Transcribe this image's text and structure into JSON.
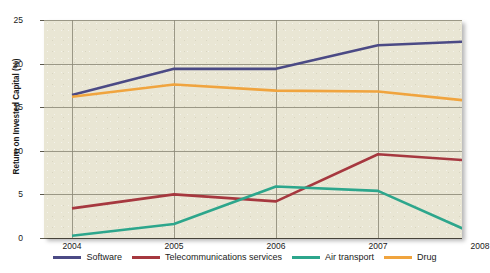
{
  "chart_data": {
    "type": "line",
    "title": "",
    "xlabel": "",
    "ylabel": "Return on Invested Capital (%)",
    "categories": [
      "2004",
      "2005",
      "2006",
      "2007",
      "2008"
    ],
    "x": [
      2004,
      2005,
      2006,
      2007,
      2008
    ],
    "ylim": [
      0,
      25
    ],
    "yticks": [
      0,
      5,
      10,
      15,
      20,
      25
    ],
    "grid": true,
    "legend_position": "bottom",
    "series": [
      {
        "name": "Software",
        "color": "#4b4a85",
        "values": [
          16.4,
          19.4,
          19.4,
          22.1,
          22.6
        ]
      },
      {
        "name": "Telecommunications services",
        "color": "#a6383f",
        "values": [
          3.4,
          5.0,
          4.2,
          9.6,
          8.8
        ]
      },
      {
        "name": "Air transport",
        "color": "#2da68c",
        "values": [
          0.25,
          1.6,
          5.9,
          5.4,
          0.2
        ]
      },
      {
        "name": "Drug",
        "color": "#f0a43e",
        "values": [
          16.2,
          17.6,
          16.9,
          16.8,
          15.6
        ]
      }
    ]
  },
  "axes": {
    "y_tick_labels": [
      "25",
      "20",
      "15",
      "10",
      "5",
      "0"
    ],
    "x_tick_labels": [
      "2004",
      "2005",
      "2006",
      "2007",
      "2008"
    ],
    "y_axis_title": "Return on Invested Capital (%)"
  },
  "legend": {
    "items": [
      {
        "label": "Software",
        "color": "#4b4a85"
      },
      {
        "label": "Telecommunications services",
        "color": "#a6383f"
      },
      {
        "label": "Air transport",
        "color": "#2da68c"
      },
      {
        "label": "Drug",
        "color": "#f0a43e"
      }
    ]
  },
  "style": {
    "plot_background": "#e9e6d4",
    "grid_color": "#8d8a78",
    "page_background": "#ffffff"
  }
}
